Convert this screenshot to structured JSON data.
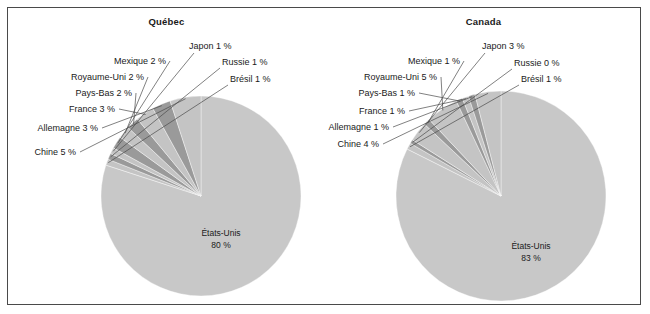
{
  "figure": {
    "background": "#ffffff",
    "frame_color": "#4a4a4a",
    "panels": [
      "Québec",
      "Canada"
    ]
  },
  "palette": {
    "main_slice": "#c8c8c8",
    "dark_gray": "#9a9a9a",
    "light_gray": "#c4c4c4",
    "text": "#1a1a1a",
    "leader_line": "#4a4a4a"
  },
  "quebec": {
    "title": "Québec",
    "center_label_name": "États-Unis",
    "center_label_value": "80 %",
    "labels": [
      {
        "text": "Chine 5 %"
      },
      {
        "text": "Allemagne 3 %"
      },
      {
        "text": "France 3 %"
      },
      {
        "text": "Pays-Bas 2 %"
      },
      {
        "text": "Royaume-Uni 2 %"
      },
      {
        "text": "Mexique 2 %"
      },
      {
        "text": "Japon 1 %"
      },
      {
        "text": "Russie 1 %"
      },
      {
        "text": "Brésil 1 %"
      }
    ]
  },
  "canada": {
    "title": "Canada",
    "center_label_name": "États-Unis",
    "center_label_value": "83 %",
    "labels": [
      {
        "text": "Chine 4 %"
      },
      {
        "text": "Allemagne 1 %"
      },
      {
        "text": "France 1 %"
      },
      {
        "text": "Pays-Bas 1 %"
      },
      {
        "text": "Royaume-Uni 5 %"
      },
      {
        "text": "Mexique 1 %"
      },
      {
        "text": "Japon 3 %"
      },
      {
        "text": "Russie 0 %"
      },
      {
        "text": "Brésil 1 %"
      }
    ]
  },
  "chart_data": [
    {
      "type": "pie",
      "title": "Québec",
      "unit": "%",
      "categories": [
        "États-Unis",
        "Brésil",
        "Russie",
        "Japon",
        "Mexique",
        "Royaume-Uni",
        "Pays-Bas",
        "France",
        "Allemagne",
        "Chine"
      ],
      "values": [
        80,
        1,
        1,
        1,
        2,
        2,
        2,
        3,
        3,
        5
      ],
      "labels": [
        "États-Unis 80 %",
        "Brésil 1 %",
        "Russie 1 %",
        "Japon 1 %",
        "Mexique 2 %",
        "Royaume-Uni 2 %",
        "Pays-Bas 2 %",
        "France 3 %",
        "Allemagne 3 %",
        "Chine 5 %"
      ],
      "colors": [
        "#c8c8c8",
        "#c4c4c4",
        "#9a9a9a",
        "#c4c4c4",
        "#9a9a9a",
        "#c4c4c4",
        "#9a9a9a",
        "#c4c4c4",
        "#9a9a9a",
        "#c4c4c4"
      ],
      "legend": "none",
      "start_angle_deg": -90,
      "direction": "clockwise"
    },
    {
      "type": "pie",
      "title": "Canada",
      "unit": "%",
      "categories": [
        "États-Unis",
        "Brésil",
        "Russie",
        "Japon",
        "Mexique",
        "Royaume-Uni",
        "Pays-Bas",
        "France",
        "Allemagne",
        "Chine"
      ],
      "values": [
        83,
        1,
        0,
        3,
        1,
        5,
        1,
        1,
        1,
        4
      ],
      "labels": [
        "États-Unis 83 %",
        "Brésil 1 %",
        "Russie 0 %",
        "Japon 3 %",
        "Mexique 1 %",
        "Royaume-Uni 5 %",
        "Pays-Bas 1 %",
        "France 1 %",
        "Allemagne 1 %",
        "Chine 4 %"
      ],
      "colors": [
        "#c8c8c8",
        "#c4c4c4",
        "#9a9a9a",
        "#c4c4c4",
        "#9a9a9a",
        "#c4c4c4",
        "#9a9a9a",
        "#c4c4c4",
        "#9a9a9a",
        "#c4c4c4"
      ],
      "legend": "none",
      "start_angle_deg": -90,
      "direction": "clockwise"
    }
  ]
}
